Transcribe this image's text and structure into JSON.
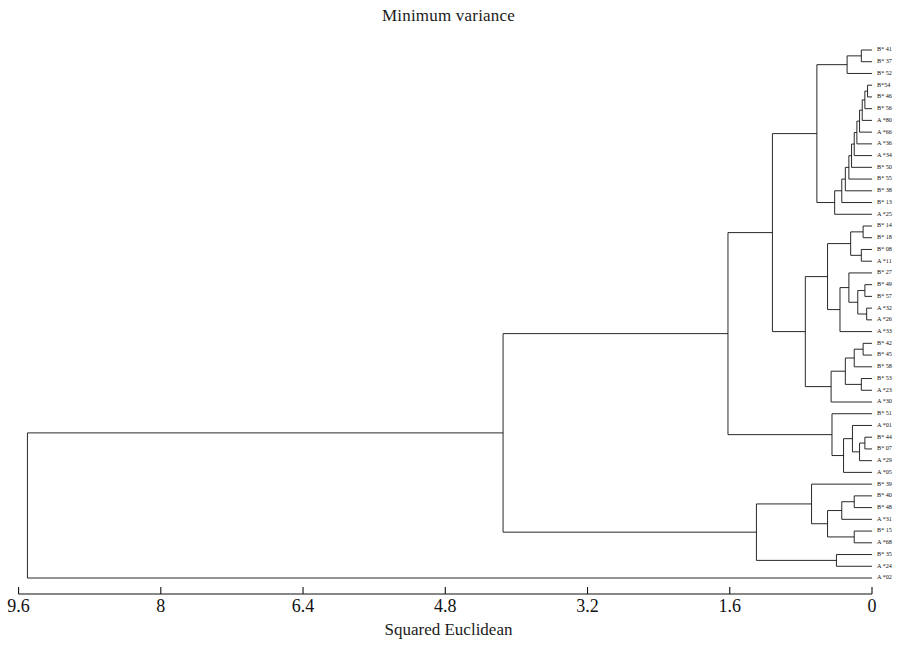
{
  "chart": {
    "title": "Minimum variance",
    "xlabel": "Squared Euclidean"
  },
  "chart_data": {
    "type": "dendrogram",
    "title": "Minimum variance",
    "xlabel": "Squared Euclidean",
    "ylabel": "",
    "orientation": "horizontal-reversed",
    "grid": false,
    "legend": null,
    "xlim": [
      9.6,
      0
    ],
    "xticks": [
      "9.6",
      "8",
      "6.4",
      "4.8",
      "3.2",
      "1.6",
      "0"
    ],
    "xtick_values": [
      9.6,
      8,
      6.4,
      4.8,
      3.2,
      1.6,
      0
    ],
    "distance_metric": "Squared Euclidean",
    "linkage": "Minimum variance",
    "leaves": [
      "B* 41",
      "B* 37",
      "B* 52",
      "B*54",
      "B* 46",
      "B* 56",
      "A *80",
      "A *66",
      "A *36",
      "A *34",
      "B* 50",
      "B* 55",
      "B* 38",
      "B* 13",
      "A *25",
      "B* 14",
      "B* 18",
      "B* 08",
      "A *11",
      "B* 27",
      "B* 49",
      "B* 57",
      "A *32",
      "A *26",
      "A *33",
      "B* 42",
      "B* 45",
      "B* 58",
      "B* 53",
      "A *23",
      "A *30",
      "B* 51",
      "A *01",
      "B* 44",
      "B* 07",
      "A *29",
      "A *05",
      "B* 39",
      "B* 40",
      "B* 48",
      "A *31",
      "B* 15",
      "A *68",
      "B* 35",
      "A *24",
      "A *02"
    ],
    "merges": [
      {
        "left": "B* 41",
        "right": "B* 37",
        "height": 0.12
      },
      {
        "left": "n0",
        "right": "B* 52",
        "height": 0.28
      },
      {
        "left": "B*54",
        "right": "B* 46",
        "height": 0.05
      },
      {
        "left": "n2",
        "right": "B* 56",
        "height": 0.08
      },
      {
        "left": "n3",
        "right": "A *80",
        "height": 0.11
      },
      {
        "left": "n4",
        "right": "A *66",
        "height": 0.14
      },
      {
        "left": "n5",
        "right": "A *36",
        "height": 0.17
      },
      {
        "left": "n6",
        "right": "A *34",
        "height": 0.2
      },
      {
        "left": "n7",
        "right": "B* 50",
        "height": 0.23
      },
      {
        "left": "n8",
        "right": "B* 55",
        "height": 0.26
      },
      {
        "left": "n9",
        "right": "B* 38",
        "height": 0.3
      },
      {
        "left": "n10",
        "right": "B* 13",
        "height": 0.34
      },
      {
        "left": "n11",
        "right": "A *25",
        "height": 0.42
      },
      {
        "left": "n1",
        "right": "n12",
        "height": 0.62
      },
      {
        "left": "B* 14",
        "right": "B* 18",
        "height": 0.1
      },
      {
        "left": "B* 08",
        "right": "A *11",
        "height": 0.12
      },
      {
        "left": "n14",
        "right": "n15",
        "height": 0.24
      },
      {
        "left": "B* 49",
        "right": "B* 57",
        "height": 0.08
      },
      {
        "left": "A *32",
        "right": "A *26",
        "height": 0.06
      },
      {
        "left": "n17",
        "right": "n18",
        "height": 0.16
      },
      {
        "left": "B* 27",
        "right": "n19",
        "height": 0.26
      },
      {
        "left": "n20",
        "right": "A *33",
        "height": 0.36
      },
      {
        "left": "n16",
        "right": "n21",
        "height": 0.5
      },
      {
        "left": "B* 42",
        "right": "B* 45",
        "height": 0.1
      },
      {
        "left": "n23",
        "right": "B* 58",
        "height": 0.2
      },
      {
        "left": "B* 53",
        "right": "A *23",
        "height": 0.12
      },
      {
        "left": "n24",
        "right": "n25",
        "height": 0.3
      },
      {
        "left": "n26",
        "right": "A *30",
        "height": 0.46
      },
      {
        "left": "n22",
        "right": "n27",
        "height": 0.75
      },
      {
        "left": "n13",
        "right": "n28",
        "height": 1.12
      },
      {
        "left": "B* 44",
        "right": "B* 07",
        "height": 0.08
      },
      {
        "left": "n30",
        "right": "A *29",
        "height": 0.14
      },
      {
        "left": "A *01",
        "right": "n31",
        "height": 0.22
      },
      {
        "left": "n32",
        "right": "A *05",
        "height": 0.32
      },
      {
        "left": "B* 51",
        "right": "n33",
        "height": 0.45
      },
      {
        "left": "n29",
        "right": "n34",
        "height": 1.62
      },
      {
        "left": "B* 40",
        "right": "B* 48",
        "height": 0.2
      },
      {
        "left": "n36",
        "right": "A *31",
        "height": 0.34
      },
      {
        "left": "B* 15",
        "right": "A *68",
        "height": 0.2
      },
      {
        "left": "n37",
        "right": "n38",
        "height": 0.5
      },
      {
        "left": "B* 39",
        "right": "n39",
        "height": 0.68
      },
      {
        "left": "B* 35",
        "right": "A *24",
        "height": 0.4
      },
      {
        "left": "n40",
        "right": "n41",
        "height": 1.3
      },
      {
        "left": "n35",
        "right": "n42",
        "height": 4.15
      },
      {
        "left": "n43",
        "right": "A *02",
        "height": 9.5
      }
    ],
    "n_leaves": 46,
    "root_height": 9.5
  }
}
